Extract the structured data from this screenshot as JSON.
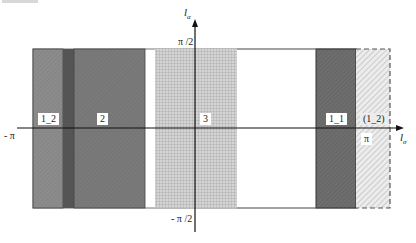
{
  "diagram": {
    "type": "region-partition-plot",
    "x_axis": {
      "name": "l",
      "subscript": "σ",
      "tick_left": "- π",
      "tick_right": "π"
    },
    "y_axis": {
      "name": "l",
      "subscript": "α",
      "tick_top": "π /2",
      "tick_bottom": "- π /2"
    },
    "regions": [
      {
        "id": "r1_2",
        "label": "1_2",
        "fill": "#8c8c8c",
        "pattern": "fine-hatch"
      },
      {
        "id": "strip",
        "label": "",
        "fill": "#555555",
        "pattern": "solid"
      },
      {
        "id": "r2",
        "label": "2",
        "fill": "#7a7a7a",
        "pattern": "fine-hatch"
      },
      {
        "id": "r3",
        "label": "3",
        "fill": "#c9c9c9",
        "pattern": "grid"
      },
      {
        "id": "blank",
        "label": "",
        "fill": "#ffffff",
        "pattern": "none"
      },
      {
        "id": "r1_1",
        "label": "1_1",
        "fill": "#6a6a6a",
        "pattern": "diagonal-hatch"
      },
      {
        "id": "r1_2_periodic",
        "label": "(1_2)",
        "fill": "#e3e3e3",
        "pattern": "diagonal-hatch-dashed-border"
      }
    ],
    "colors": {
      "axis": "#111111",
      "border": "#333333"
    }
  }
}
